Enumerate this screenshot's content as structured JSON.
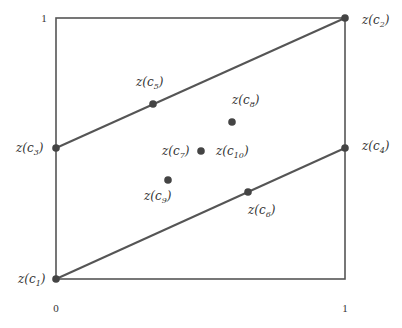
{
  "diagram": {
    "axes": {
      "x_ticks": [
        {
          "label": "0",
          "x": 56
        },
        {
          "label": "1",
          "x": 345
        }
      ],
      "y_ticks": [
        {
          "label": "1",
          "y": 18
        }
      ]
    },
    "box": {
      "left": 56,
      "top": 18,
      "right": 345,
      "bottom": 279
    },
    "colors": {
      "line": "#555555",
      "point": "#444444",
      "text": "#333333"
    },
    "lines": [
      {
        "name": "upper-line",
        "from": "c3",
        "to": "c2"
      },
      {
        "name": "lower-line",
        "from": "c1",
        "to": "c4"
      }
    ],
    "points": [
      {
        "id": "c1",
        "label": "z(c",
        "sub": "1",
        "x": 56,
        "y": 279,
        "lx": 18,
        "ly": 283
      },
      {
        "id": "c2",
        "label": "z(c",
        "sub": "2",
        "x": 345,
        "y": 18,
        "lx": 362,
        "ly": 24
      },
      {
        "id": "c3",
        "label": "z(c",
        "sub": "3",
        "x": 56,
        "y": 148,
        "lx": 16,
        "ly": 152
      },
      {
        "id": "c4",
        "label": "z(c",
        "sub": "4",
        "x": 345,
        "y": 148,
        "lx": 362,
        "ly": 150
      },
      {
        "id": "c5",
        "label": "z(c",
        "sub": "5",
        "x": 153,
        "y": 104,
        "lx": 136,
        "ly": 86
      },
      {
        "id": "c6",
        "label": "z(c",
        "sub": "6",
        "x": 248,
        "y": 192,
        "lx": 248,
        "ly": 214
      },
      {
        "id": "c7",
        "label": "z(c",
        "sub": "7",
        "x": 201,
        "y": 151,
        "lx": 162,
        "ly": 155
      },
      {
        "id": "c8",
        "label": "z(c",
        "sub": "8",
        "x": 232,
        "y": 122,
        "lx": 232,
        "ly": 104
      },
      {
        "id": "c9",
        "label": "z(c",
        "sub": "9",
        "x": 168,
        "y": 180,
        "lx": 144,
        "ly": 200
      },
      {
        "id": "c10",
        "label": "z(c",
        "sub": "10",
        "x": null,
        "y": null,
        "lx": 216,
        "ly": 155
      }
    ]
  }
}
